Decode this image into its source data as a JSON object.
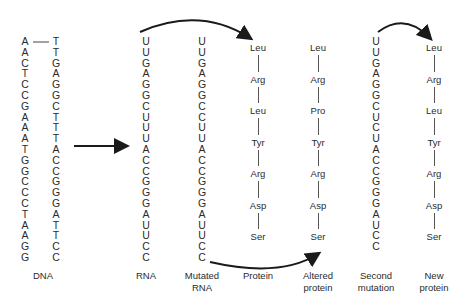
{
  "columns": {
    "dna_left": [
      "A",
      "A",
      "C",
      "T",
      "C",
      "C",
      "G",
      "A",
      "A",
      "A",
      "T",
      "G",
      "G",
      "C",
      "C",
      "C",
      "T",
      "A",
      "A",
      "G",
      "G"
    ],
    "dna_right": [
      "T",
      "T",
      "G",
      "A",
      "G",
      "G",
      "C",
      "T",
      "T",
      "T",
      "A",
      "C",
      "C",
      "G",
      "G",
      "G",
      "A",
      "T",
      "T",
      "C",
      "C"
    ],
    "rna": [
      "U",
      "U",
      "G",
      "A",
      "G",
      "G",
      "C",
      "U",
      "U",
      "U",
      "A",
      "C",
      "C",
      "G",
      "G",
      "G",
      "A",
      "U",
      "U",
      "C",
      "C"
    ],
    "mutated_rna": [
      "U",
      "U",
      "G",
      "A",
      "G",
      "G",
      "C",
      "C",
      "U",
      "U",
      "A",
      "C",
      "C",
      "G",
      "G",
      "G",
      "A",
      "U",
      "U",
      "C",
      "C"
    ],
    "second_mutation": [
      "U",
      "U",
      "G",
      "A",
      "G",
      "G",
      "C",
      "U",
      "C",
      "U",
      "A",
      "C",
      "C",
      "G",
      "G",
      "G",
      "A",
      "U",
      "C",
      "C"
    ]
  },
  "proteins": {
    "protein": [
      "Leu",
      "Arg",
      "Leu",
      "Tyr",
      "Arg",
      "Asp",
      "Ser"
    ],
    "altered_protein": [
      "Leu",
      "Arg",
      "Pro",
      "Tyr",
      "Arg",
      "Asp",
      "Ser"
    ],
    "new_protein": [
      "Leu",
      "Arg",
      "Leu",
      "Tyr",
      "Arg",
      "Asp",
      "Ser"
    ]
  },
  "labels": {
    "dna": "DNA",
    "rna": "RNA",
    "mutated_rna_1": "Mutated",
    "mutated_rna_2": "RNA",
    "protein": "Protein",
    "altered_protein_1": "Altered",
    "altered_protein_2": "protein",
    "second_mutation_1": "Second",
    "second_mutation_2": "mutation",
    "new_protein_1": "New",
    "new_protein_2": "protein"
  },
  "arrows": [
    {
      "from": "DNA",
      "to": "RNA",
      "icon": "arrow-right-icon"
    },
    {
      "from": "RNA",
      "to": "Protein",
      "icon": "curved-arrow-icon"
    },
    {
      "from": "Mutated RNA",
      "to": "Altered protein",
      "icon": "curved-arrow-icon"
    },
    {
      "from": "Second mutation",
      "to": "New protein",
      "icon": "curved-arrow-icon"
    }
  ]
}
